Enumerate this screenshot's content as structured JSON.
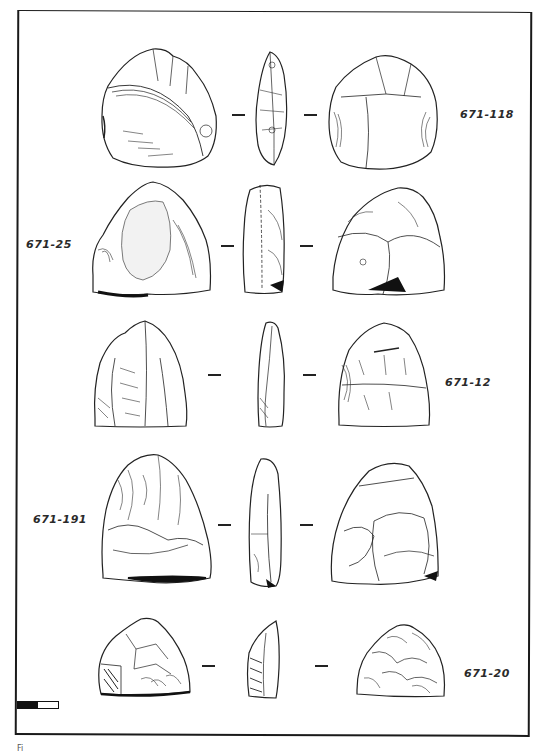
{
  "figure": {
    "type": "archaeological lithic artifact plate",
    "views_per_artifact": [
      "dorsal",
      "profile",
      "ventral"
    ],
    "rows": [
      {
        "label": "671-118",
        "label_side": "right"
      },
      {
        "label": "671-25",
        "label_side": "left"
      },
      {
        "label": "671-12",
        "label_side": "right"
      },
      {
        "label": "671-191",
        "label_side": "left"
      },
      {
        "label": "671-20",
        "label_side": "right"
      }
    ],
    "scale_bar": {
      "segments": [
        "black",
        "white"
      ]
    },
    "caption_fragment": "Fi"
  }
}
